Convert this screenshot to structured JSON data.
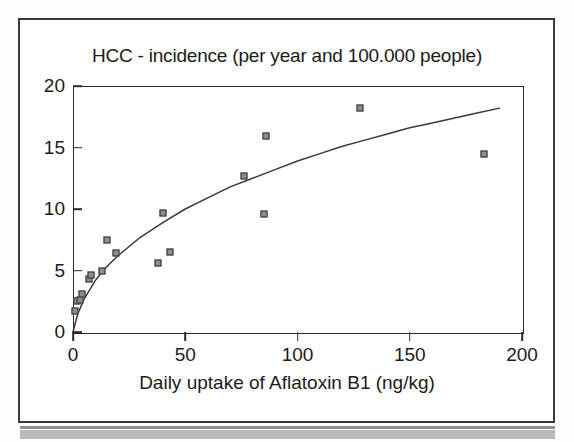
{
  "chart_data": {
    "type": "scatter",
    "title": "HCC - incidence (per year and 100.000 people)",
    "xlabel": "Daily uptake of Aflatoxin B1 (ng/kg)",
    "ylabel": "",
    "xlim": [
      0,
      200
    ],
    "ylim": [
      0,
      20
    ],
    "xticks": [
      "0",
      "50",
      "100",
      "150",
      "200"
    ],
    "xtick_values": [
      0,
      50,
      100,
      150,
      200
    ],
    "yticks": [
      "0",
      "5",
      "10",
      "15",
      "20"
    ],
    "ytick_values": [
      0,
      5,
      10,
      15,
      20
    ],
    "grid": false,
    "legend": "none",
    "marker_style": "filled-square-outline",
    "points": [
      {
        "x": 1,
        "y": 1.7
      },
      {
        "x": 2,
        "y": 2.5
      },
      {
        "x": 3,
        "y": 2.6
      },
      {
        "x": 4,
        "y": 3.1
      },
      {
        "x": 7,
        "y": 4.3
      },
      {
        "x": 8,
        "y": 4.6
      },
      {
        "x": 13,
        "y": 5.0
      },
      {
        "x": 15,
        "y": 7.5
      },
      {
        "x": 19,
        "y": 6.4
      },
      {
        "x": 38,
        "y": 5.6
      },
      {
        "x": 40,
        "y": 9.7
      },
      {
        "x": 43,
        "y": 6.5
      },
      {
        "x": 76,
        "y": 12.7
      },
      {
        "x": 85,
        "y": 9.6
      },
      {
        "x": 86,
        "y": 15.9
      },
      {
        "x": 128,
        "y": 18.2
      },
      {
        "x": 183,
        "y": 14.5
      }
    ],
    "fit_curve": {
      "description": "saturating fitted trend line",
      "points": [
        {
          "x": 0,
          "y": 0.0
        },
        {
          "x": 2,
          "y": 1.4
        },
        {
          "x": 5,
          "y": 2.7
        },
        {
          "x": 10,
          "y": 4.2
        },
        {
          "x": 15,
          "y": 5.3
        },
        {
          "x": 20,
          "y": 6.2
        },
        {
          "x": 30,
          "y": 7.7
        },
        {
          "x": 40,
          "y": 8.9
        },
        {
          "x": 50,
          "y": 10.0
        },
        {
          "x": 60,
          "y": 10.9
        },
        {
          "x": 70,
          "y": 11.8
        },
        {
          "x": 80,
          "y": 12.5
        },
        {
          "x": 90,
          "y": 13.2
        },
        {
          "x": 100,
          "y": 13.9
        },
        {
          "x": 110,
          "y": 14.5
        },
        {
          "x": 120,
          "y": 15.1
        },
        {
          "x": 130,
          "y": 15.6
        },
        {
          "x": 140,
          "y": 16.1
        },
        {
          "x": 150,
          "y": 16.6
        },
        {
          "x": 160,
          "y": 17.0
        },
        {
          "x": 170,
          "y": 17.4
        },
        {
          "x": 180,
          "y": 17.8
        },
        {
          "x": 190,
          "y": 18.2
        }
      ]
    },
    "colors": {
      "axis": "#2b2b2b",
      "text": "#1b1b1b",
      "marker_fill": "#8d8d8d",
      "marker_edge": "#2e2e2e",
      "curve": "#3a3a3a",
      "page_border": "#3a3a3a"
    }
  }
}
